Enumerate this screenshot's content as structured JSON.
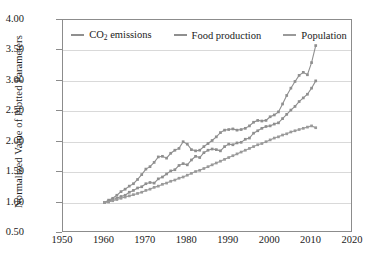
{
  "chart_data": {
    "type": "line",
    "title": "",
    "xlabel": "",
    "ylabel": "Normalized Value of Plotted Parameters",
    "xlim": [
      1950,
      2020
    ],
    "ylim": [
      0.5,
      4.0
    ],
    "xticks": [
      1950,
      1960,
      1970,
      1980,
      1990,
      2000,
      2010,
      2020
    ],
    "yticks": [
      "0.50",
      "1.00",
      "1.50",
      "2.00",
      "2.50",
      "3.00",
      "3.50",
      "4.00"
    ],
    "grid": "horizontal",
    "legend_position": "top-center",
    "marker": "square",
    "series": [
      {
        "name": "CO2 emissions",
        "label_html": "CO<sub>2</sub> emissions",
        "color": "#8f8f8f",
        "x": [
          1960,
          1961,
          1962,
          1963,
          1964,
          1965,
          1966,
          1967,
          1968,
          1969,
          1970,
          1971,
          1972,
          1973,
          1974,
          1975,
          1976,
          1977,
          1978,
          1979,
          1980,
          1981,
          1982,
          1983,
          1984,
          1985,
          1986,
          1987,
          1988,
          1989,
          1990,
          1991,
          1992,
          1993,
          1994,
          1995,
          1996,
          1997,
          1998,
          1999,
          2000,
          2001,
          2002,
          2003,
          2004,
          2005,
          2006,
          2007,
          2008,
          2009,
          2010
        ],
        "values": [
          1.0,
          1.04,
          1.07,
          1.12,
          1.18,
          1.22,
          1.27,
          1.31,
          1.38,
          1.46,
          1.55,
          1.59,
          1.66,
          1.75,
          1.76,
          1.73,
          1.81,
          1.86,
          1.89,
          2.0,
          1.96,
          1.87,
          1.85,
          1.86,
          1.92,
          1.97,
          2.02,
          2.08,
          2.15,
          2.19,
          2.2,
          2.21,
          2.19,
          2.2,
          2.22,
          2.26,
          2.32,
          2.35,
          2.34,
          2.35,
          2.41,
          2.44,
          2.49,
          2.62,
          2.76,
          2.88,
          2.99,
          3.09,
          3.14,
          3.1,
          3.3
        ],
        "end_value": 3.58
      },
      {
        "name": "Food production",
        "label_html": "Food production",
        "color": "#8f8f8f",
        "x": [
          1960,
          1961,
          1962,
          1963,
          1964,
          1965,
          1966,
          1967,
          1968,
          1969,
          1970,
          1971,
          1972,
          1973,
          1974,
          1975,
          1976,
          1977,
          1978,
          1979,
          1980,
          1981,
          1982,
          1983,
          1984,
          1985,
          1986,
          1987,
          1988,
          1989,
          1990,
          1991,
          1992,
          1993,
          1994,
          1995,
          1996,
          1997,
          1998,
          1999,
          2000,
          2001,
          2002,
          2003,
          2004,
          2005,
          2006,
          2007,
          2008,
          2009,
          2010
        ],
        "values": [
          1.0,
          1.02,
          1.05,
          1.07,
          1.1,
          1.12,
          1.17,
          1.2,
          1.24,
          1.26,
          1.31,
          1.33,
          1.32,
          1.39,
          1.42,
          1.47,
          1.52,
          1.54,
          1.61,
          1.64,
          1.62,
          1.7,
          1.76,
          1.74,
          1.82,
          1.86,
          1.88,
          1.87,
          1.85,
          1.92,
          1.96,
          1.95,
          1.98,
          1.99,
          2.04,
          2.06,
          2.14,
          2.18,
          2.22,
          2.25,
          2.26,
          2.29,
          2.31,
          2.38,
          2.45,
          2.52,
          2.58,
          2.66,
          2.72,
          2.78,
          2.88
        ],
        "end_value": 3.0
      },
      {
        "name": "Population",
        "label_html": "Population",
        "color": "#9a9a9a",
        "x": [
          1960,
          1961,
          1962,
          1963,
          1964,
          1965,
          1966,
          1967,
          1968,
          1969,
          1970,
          1971,
          1972,
          1973,
          1974,
          1975,
          1976,
          1977,
          1978,
          1979,
          1980,
          1981,
          1982,
          1983,
          1984,
          1985,
          1986,
          1987,
          1988,
          1989,
          1990,
          1991,
          1992,
          1993,
          1994,
          1995,
          1996,
          1997,
          1998,
          1999,
          2000,
          2001,
          2002,
          2003,
          2004,
          2005,
          2006,
          2007,
          2008,
          2009,
          2010
        ],
        "values": [
          1.0,
          1.01,
          1.03,
          1.05,
          1.07,
          1.09,
          1.11,
          1.13,
          1.15,
          1.17,
          1.2,
          1.22,
          1.25,
          1.27,
          1.3,
          1.32,
          1.35,
          1.37,
          1.4,
          1.42,
          1.45,
          1.48,
          1.51,
          1.53,
          1.56,
          1.59,
          1.62,
          1.65,
          1.68,
          1.71,
          1.74,
          1.77,
          1.8,
          1.83,
          1.86,
          1.89,
          1.92,
          1.95,
          1.97,
          2.0,
          2.03,
          2.06,
          2.08,
          2.11,
          2.13,
          2.16,
          2.18,
          2.2,
          2.22,
          2.24,
          2.26
        ],
        "end_value": 2.23
      }
    ]
  },
  "legend": {
    "items": [
      {
        "label": "CO2 emissions"
      },
      {
        "label": "Food production"
      },
      {
        "label": "Population"
      }
    ]
  }
}
